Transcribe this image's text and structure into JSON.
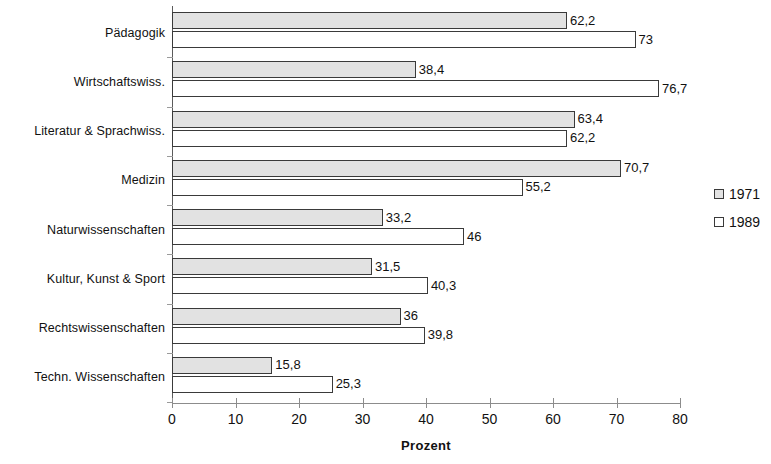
{
  "chart_data": {
    "type": "bar",
    "orientation": "horizontal",
    "title": "",
    "xlabel": "Prozent",
    "ylabel": "",
    "xlim": [
      0,
      80
    ],
    "xticks": [
      0,
      10,
      20,
      30,
      40,
      50,
      60,
      70,
      80
    ],
    "xtick_labels": [
      "0",
      "10",
      "20",
      "30",
      "40",
      "50",
      "60",
      "70",
      "80"
    ],
    "grid": false,
    "legend_position": "right",
    "categories": [
      "Pädagogik",
      "Wirtschaftswiss.",
      "Literatur & Sprachwiss.",
      "Medizin",
      "Naturwissenschaften",
      "Kultur, Kunst & Sport",
      "Rechtswissenschaften",
      "Techn. Wissenschaften"
    ],
    "series": [
      {
        "name": "1971",
        "color": "#e2e2e2",
        "values": [
          62.2,
          38.4,
          63.4,
          70.7,
          33.2,
          31.5,
          36,
          15.8
        ],
        "value_labels": [
          "62,2",
          "38,4",
          "63,4",
          "70,7",
          "33,2",
          "31,5",
          "36",
          "15,8"
        ]
      },
      {
        "name": "1989",
        "color": "#ffffff",
        "values": [
          73,
          76.7,
          62.2,
          55.2,
          46,
          40.3,
          39.8,
          25.3
        ],
        "value_labels": [
          "73",
          "76,7",
          "62,2",
          "55,2",
          "46",
          "40,3",
          "39,8",
          "25,3"
        ]
      }
    ]
  },
  "legend": {
    "items": [
      {
        "label": "1971",
        "swatch": "#e2e2e2"
      },
      {
        "label": "1989",
        "swatch": "#ffffff"
      }
    ]
  }
}
